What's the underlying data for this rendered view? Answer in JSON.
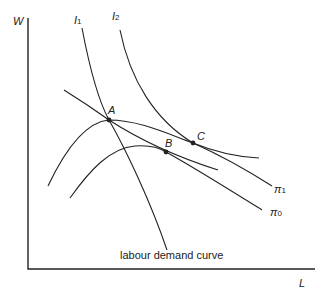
{
  "axes": {
    "y_label": "W",
    "x_label": "L"
  },
  "curves": {
    "i1": {
      "label": "I",
      "sub": "1"
    },
    "i2": {
      "label": "I",
      "sub": "2"
    },
    "pi1": {
      "label": "π",
      "sub": "1"
    },
    "pi0": {
      "label": "π",
      "sub": "0"
    }
  },
  "points": {
    "a": "A",
    "b": "B",
    "c": "C"
  },
  "annotation": "labour demand curve",
  "colors": {
    "line": "#222222",
    "background": "#ffffff"
  }
}
